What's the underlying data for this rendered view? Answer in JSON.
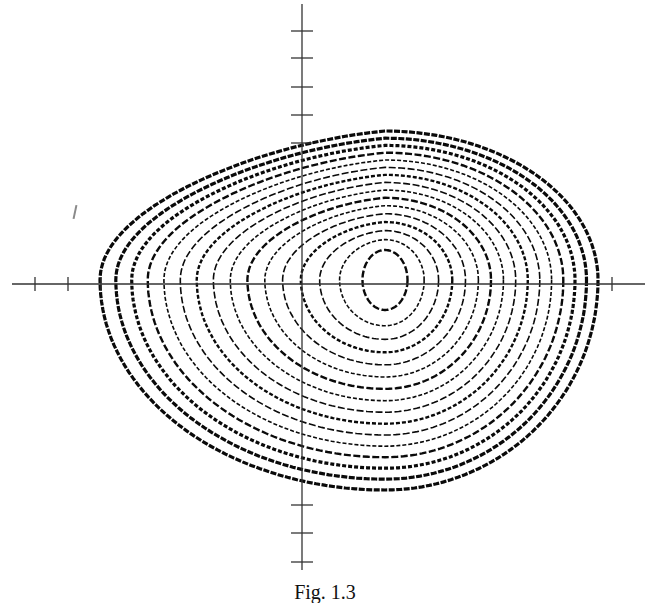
{
  "figure": {
    "caption": "Fig. 1.3",
    "colors": {
      "ink": "#0a0a0a",
      "axis": "#333333",
      "background": "#ffffff"
    }
  },
  "chart_data": {
    "type": "line",
    "title": "",
    "subtitle": "Phase portrait: spiral trajectory converging to a focus (limit region)",
    "xlabel": "",
    "ylabel": "",
    "grid": false,
    "legend": null,
    "axes": {
      "origin_px": [
        302,
        284
      ],
      "x_axis_px": [
        12,
        645
      ],
      "y_axis_px": [
        4,
        570
      ],
      "x_ticks_px": [
        35,
        68,
        101,
        612
      ],
      "y_ticks_px": [
        31,
        58,
        87,
        115,
        143,
        505,
        533,
        562
      ]
    },
    "trajectory": {
      "center_px": [
        385,
        280
      ],
      "inner_loop_size_px": [
        45,
        60
      ],
      "outer_bounds_px": {
        "left": 100,
        "right": 598,
        "top": 131,
        "bottom": 490
      },
      "turns": 15
    }
  }
}
